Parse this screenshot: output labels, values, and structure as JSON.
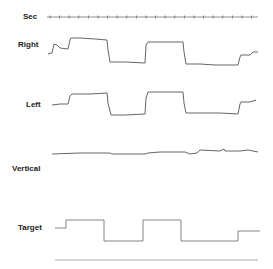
{
  "figure": {
    "labels": {
      "sec": "Sec",
      "right": "Right",
      "left": "Left",
      "vertical": "Vertical",
      "target": "Target"
    },
    "colors": {
      "trace": "#555555",
      "text": "#222222",
      "baseline": "#9a9a9a"
    }
  },
  "chart_data": {
    "type": "line",
    "title": "",
    "xlabel": "Time (sec ticks)",
    "ylabel": "",
    "time_marker": {
      "label": "Sec",
      "tick_count": 22,
      "tick_spacing_px": 9.6
    },
    "series": [
      {
        "name": "Right",
        "points_px": [
          [
            48,
            54
          ],
          [
            52,
            53
          ],
          [
            54,
            44
          ],
          [
            57,
            45
          ],
          [
            60,
            48
          ],
          [
            68,
            49
          ],
          [
            70,
            40
          ],
          [
            71,
            38
          ],
          [
            80,
            38
          ],
          [
            95,
            39
          ],
          [
            107,
            40
          ],
          [
            108,
            50
          ],
          [
            110,
            62
          ],
          [
            125,
            62
          ],
          [
            145,
            63
          ],
          [
            146,
            45
          ],
          [
            148,
            42
          ],
          [
            165,
            42
          ],
          [
            183,
            42
          ],
          [
            184,
            52
          ],
          [
            186,
            64
          ],
          [
            200,
            64
          ],
          [
            215,
            65
          ],
          [
            238,
            65
          ],
          [
            240,
            57
          ],
          [
            241,
            55
          ],
          [
            250,
            55
          ],
          [
            253,
            52
          ],
          [
            258,
            52
          ]
        ]
      },
      {
        "name": "Left",
        "points_px": [
          [
            52,
            105
          ],
          [
            60,
            104
          ],
          [
            68,
            104
          ],
          [
            70,
            96
          ],
          [
            72,
            94
          ],
          [
            90,
            94
          ],
          [
            107,
            93
          ],
          [
            108,
            103
          ],
          [
            111,
            115
          ],
          [
            125,
            115
          ],
          [
            145,
            114
          ],
          [
            146,
            98
          ],
          [
            148,
            92
          ],
          [
            165,
            92
          ],
          [
            183,
            92
          ],
          [
            184,
            103
          ],
          [
            186,
            113
          ],
          [
            200,
            113
          ],
          [
            220,
            113
          ],
          [
            238,
            114
          ],
          [
            240,
            104
          ],
          [
            241,
            102
          ],
          [
            250,
            102
          ],
          [
            253,
            101
          ],
          [
            256,
            100
          ]
        ]
      },
      {
        "name": "Vertical",
        "points_px": [
          [
            52,
            154
          ],
          [
            80,
            153
          ],
          [
            110,
            153
          ],
          [
            112,
            154
          ],
          [
            145,
            154
          ],
          [
            148,
            153
          ],
          [
            160,
            152
          ],
          [
            185,
            152
          ],
          [
            190,
            154
          ],
          [
            197,
            153
          ],
          [
            200,
            150
          ],
          [
            220,
            151
          ],
          [
            224,
            149
          ],
          [
            225,
            151
          ],
          [
            240,
            151
          ],
          [
            248,
            150
          ],
          [
            258,
            152
          ]
        ]
      },
      {
        "name": "Target",
        "points_px": [
          [
            55,
            228
          ],
          [
            66,
            228
          ],
          [
            66,
            220
          ],
          [
            104,
            220
          ],
          [
            104,
            241
          ],
          [
            143,
            241
          ],
          [
            143,
            220
          ],
          [
            181,
            220
          ],
          [
            181,
            241
          ],
          [
            238,
            241
          ],
          [
            238,
            231
          ],
          [
            260,
            231
          ]
        ],
        "type": "step"
      }
    ],
    "baseline": {
      "y_px": 260,
      "x_range_px": [
        55,
        258
      ]
    }
  }
}
